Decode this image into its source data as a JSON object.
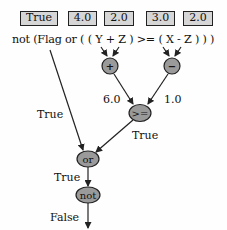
{
  "value_boxes": [
    {
      "label": "True",
      "x": 20,
      "w": 38
    },
    {
      "label": "4.0",
      "x": 68,
      "w": 29
    },
    {
      "label": "2.0",
      "x": 104,
      "w": 30
    },
    {
      "label": "3.0",
      "x": 146,
      "w": 29
    },
    {
      "label": "2.0",
      "x": 183,
      "w": 30
    }
  ],
  "expression": "not (Flag or ( ( Y + Z ) >= ( X - Z ) ) )",
  "nodes": {
    "plus": {
      "op": "+"
    },
    "minus": {
      "op": "−"
    },
    "ge": {
      "op": ">="
    },
    "or": {
      "op": "or"
    },
    "not": {
      "op": "not"
    }
  },
  "edge_labels": {
    "plus_result": "6.0",
    "minus_result": "1.0",
    "flag_value": "True",
    "ge_result": "True",
    "or_result": "True",
    "not_result": "False"
  },
  "colors": {
    "box_fill": "#d6d6d6",
    "node_fill": "#9a9a9a",
    "stroke": "#222222"
  }
}
